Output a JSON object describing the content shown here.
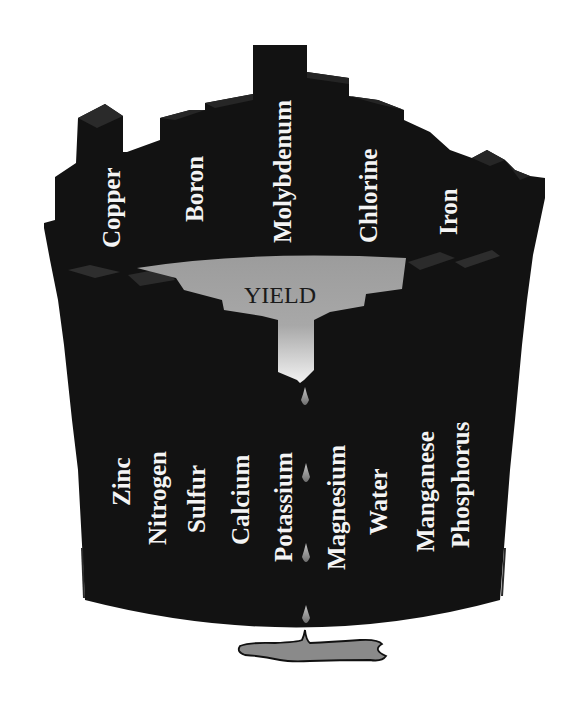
{
  "diagram": {
    "type": "limiting-factor-barrel",
    "center_label": "YIELD",
    "colors": {
      "barrel": "#121212",
      "barrel_highlight": "#2c2c2c",
      "liquid": "#9a9a9a",
      "liquid_light": "#e8e8e8",
      "label_text": "#f4f4f4",
      "background": "#ffffff"
    },
    "upper_staves": [
      {
        "label": "Copper"
      },
      {
        "label": "Boron"
      },
      {
        "label": "Molybdenum"
      },
      {
        "label": "Chlorine"
      },
      {
        "label": "Iron"
      }
    ],
    "lower_staves": [
      {
        "label": "Zinc"
      },
      {
        "label": "Nitrogen"
      },
      {
        "label": "Sulfur"
      },
      {
        "label": "Calcium"
      },
      {
        "label": "Potassium"
      },
      {
        "label": "Magnesium"
      },
      {
        "label": "Water"
      },
      {
        "label": "Manganese"
      },
      {
        "label": "Phosphorus"
      }
    ],
    "limiting_stave": "Potassium",
    "drips": 4,
    "puddle": "spilled-yield-puddle"
  }
}
